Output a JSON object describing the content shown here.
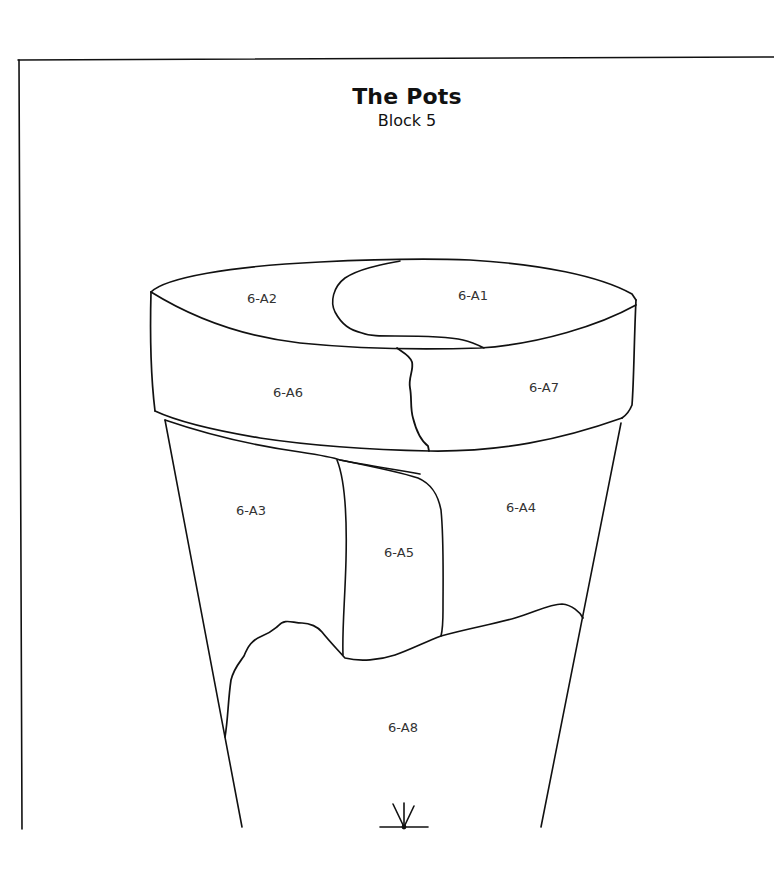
{
  "header": {
    "title": "The Pots",
    "subtitle": "Block 5"
  },
  "style": {
    "line_color": "#111111",
    "label_color": "#333333",
    "background": "#ffffff"
  },
  "pieces": [
    {
      "id": "6-A1",
      "label": "6-A1",
      "region": "rim-top-right",
      "x": 473,
      "y": 296
    },
    {
      "id": "6-A2",
      "label": "6-A2",
      "region": "rim-top-left",
      "x": 262,
      "y": 299
    },
    {
      "id": "6-A3",
      "label": "6-A3",
      "region": "body-upper-left",
      "x": 251,
      "y": 511
    },
    {
      "id": "6-A4",
      "label": "6-A4",
      "region": "body-upper-right",
      "x": 521,
      "y": 508
    },
    {
      "id": "6-A5",
      "label": "6-A5",
      "region": "body-center",
      "x": 399,
      "y": 553
    },
    {
      "id": "6-A6",
      "label": "6-A6",
      "region": "rim-band-left",
      "x": 288,
      "y": 393
    },
    {
      "id": "6-A7",
      "label": "6-A7",
      "region": "rim-band-right",
      "x": 544,
      "y": 388
    },
    {
      "id": "6-A8",
      "label": "6-A8",
      "region": "body-lower",
      "x": 403,
      "y": 728
    }
  ],
  "symbols": [
    {
      "name": "sprout-mark",
      "x": 404,
      "y": 827
    }
  ]
}
